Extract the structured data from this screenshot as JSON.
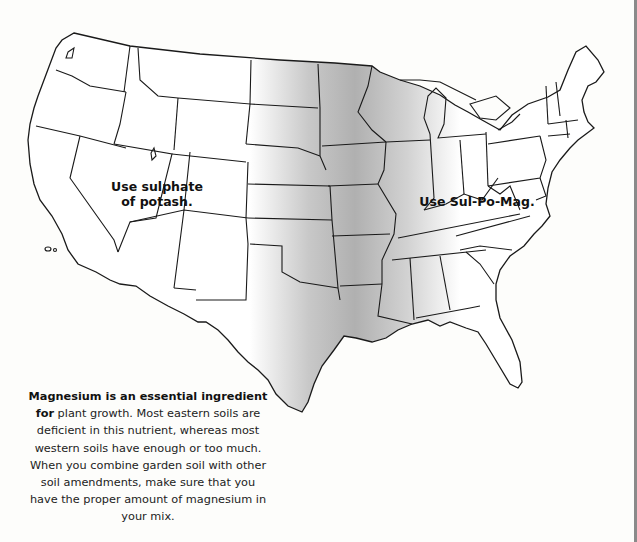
{
  "map": {
    "subject": "United States magnesium soil map",
    "regions": [
      {
        "id": "west",
        "label": "Use sulphate of potash.",
        "lines": [
          "Use sulphate",
          "of potash."
        ]
      },
      {
        "id": "east",
        "label": "Use Sul-Po-Mag.",
        "lines": [
          "Use Sul-Po-Mag."
        ]
      }
    ],
    "shaded_band": {
      "description": "Central plains states shaded gray (transition zone)",
      "color": "#b5b5b5"
    },
    "outline_color": "#1a1a1a",
    "land_color": "#ffffff"
  },
  "caption": {
    "lead": "Magnesium is an essential ingredient for",
    "body": "plant growth. Most eastern soils are deficient in this nutrient, whereas most western soils have enough or too much. When you combine garden soil with other soil amendments, make sure that you have the proper amount of magnesium in your mix."
  }
}
